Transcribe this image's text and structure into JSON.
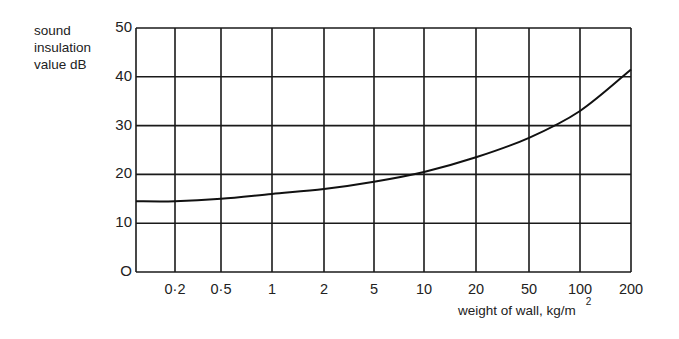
{
  "chart_data": {
    "type": "line",
    "title": "",
    "ylabel": "sound insulation value dB",
    "ylabel_lines": [
      "sound",
      "insulation",
      "value dB"
    ],
    "xlabel": "weight of wall, kg/m",
    "xlabel_superscript": "2",
    "x_scale": "log",
    "x_tick_labels": [
      "0·2",
      "0·5",
      "1",
      "2",
      "5",
      "10",
      "20",
      "50",
      "100",
      "200"
    ],
    "x_ticks": [
      0.2,
      0.5,
      1,
      2,
      5,
      10,
      20,
      50,
      100,
      200
    ],
    "y_tick_labels": [
      "O",
      "10",
      "20",
      "30",
      "40",
      "50"
    ],
    "y_ticks": [
      0,
      10,
      20,
      30,
      40,
      50
    ],
    "ylim": [
      0,
      50
    ],
    "xlim": [
      0.1,
      200
    ],
    "grid": true,
    "legend": null,
    "series": [
      {
        "name": "sound insulation",
        "x": [
          0.1,
          0.2,
          0.5,
          1,
          2,
          5,
          10,
          20,
          50,
          100,
          200
        ],
        "y": [
          14.5,
          14.5,
          15,
          16,
          17,
          18.5,
          20.5,
          23.5,
          27.5,
          33,
          41.5
        ]
      }
    ]
  }
}
